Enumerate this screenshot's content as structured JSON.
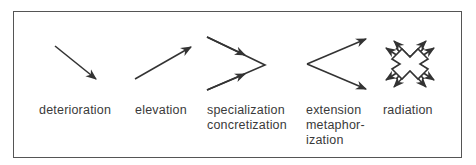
{
  "diagram": {
    "type": "semantic-change-types",
    "items": [
      {
        "id": "deterioration",
        "label": "deterioration",
        "icon": "arrow-down-right-icon"
      },
      {
        "id": "elevation",
        "label": "elevation",
        "icon": "arrow-up-right-icon"
      },
      {
        "id": "specialization",
        "label": "specialization\nconcretization",
        "icon": "converging-arrows-icon"
      },
      {
        "id": "extension",
        "label": "extension\nmetaphor-\nization",
        "icon": "diverging-arrows-icon"
      },
      {
        "id": "radiation",
        "label": "radiation",
        "icon": "radiating-arrows-icon"
      }
    ],
    "colors": {
      "stroke": "#333333",
      "text": "#3a3a3a",
      "frame": "#555555"
    }
  }
}
